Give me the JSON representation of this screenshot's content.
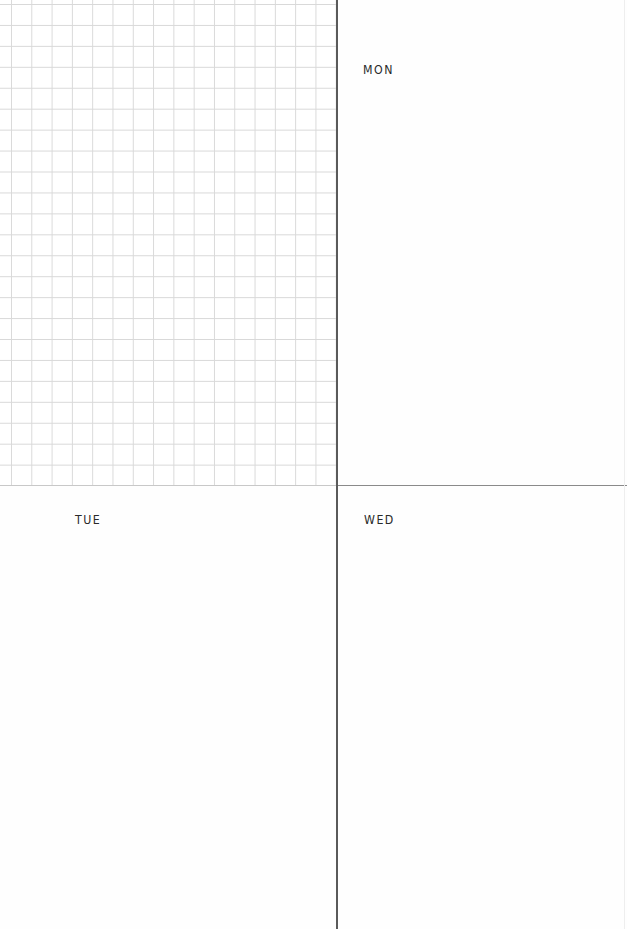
{
  "planner": {
    "grid_section": {
      "type": "grid-notes",
      "columns": 16,
      "rows": 23
    },
    "days": [
      {
        "key": "mon",
        "label": "MON"
      },
      {
        "key": "tue",
        "label": "TUE"
      },
      {
        "key": "wed",
        "label": "WED"
      }
    ]
  },
  "colors": {
    "grid_line": "#d9d9d9",
    "divider": "#5a5a5a",
    "divider_light": "#8a8a8a",
    "text": "#2a2a2a",
    "background": "#ffffff"
  }
}
